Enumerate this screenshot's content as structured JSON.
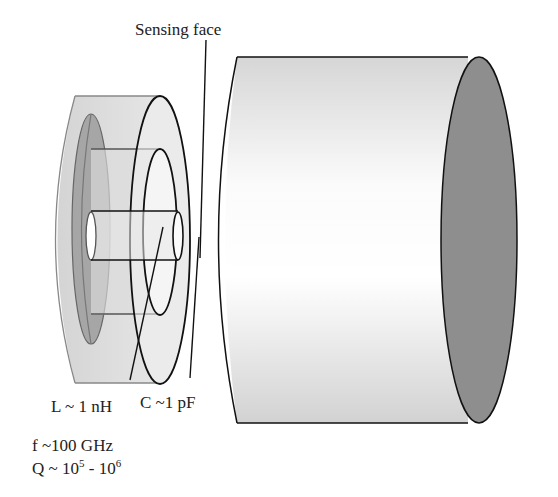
{
  "diagram": {
    "title_label": "Sensing face",
    "inductance_label": "L ~ 1 nH",
    "capacitance_label": "C ~1 pF",
    "frequency_label": "f ~100 GHz",
    "q_label_prefix": "Q ~ 10",
    "q_exp1": "5",
    "q_label_mid": " - 10",
    "q_exp2": "6"
  },
  "colors": {
    "resonator_body": "#d9d9d9",
    "resonator_inner": "#a8a8a8",
    "target_light": "#ffffff",
    "target_shade": "#dcdcdc",
    "target_end": "#8c8c8c",
    "stroke_dark": "#111111",
    "stroke_gray": "#777777"
  }
}
